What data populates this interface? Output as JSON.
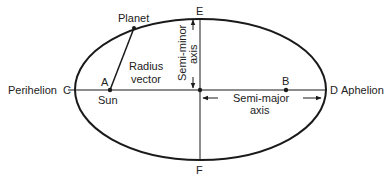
{
  "diagram": {
    "labels": {
      "planet": "Planet",
      "sun": "Sun",
      "point_a": "A",
      "point_b": "B",
      "point_c": "C",
      "point_d": "D",
      "point_e": "E",
      "point_f": "F",
      "perihelion": "Perihelion",
      "aphelion": "Aphelion",
      "radius_vector_line1": "Radius",
      "radius_vector_line2": "vector",
      "semi_minor_line1": "Semi-minor",
      "semi_minor_line2": "axis",
      "semi_major_line1": "Semi-major",
      "semi_major_line2": "axis"
    },
    "colors": {
      "stroke": "#1a1a1a",
      "text": "#222222",
      "background": "#ffffff"
    }
  }
}
